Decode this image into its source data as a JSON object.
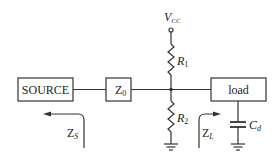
{
  "diagram": {
    "type": "circuit",
    "blocks": {
      "source": "SOURCE",
      "z0": "Z",
      "z0_sub": "0",
      "load": "load"
    },
    "supply": {
      "label": "V",
      "sub": "CC"
    },
    "resistors": [
      {
        "label": "R",
        "sub": "1"
      },
      {
        "label": "R",
        "sub": "2"
      }
    ],
    "capacitor": {
      "label": "C",
      "sub": "d"
    },
    "impedances": [
      {
        "label": "Z",
        "sub": "S",
        "direction": "left"
      },
      {
        "label": "Z",
        "sub": "L",
        "direction": "right"
      }
    ],
    "colors": {
      "stroke": "#333333",
      "background": "#ffffff"
    }
  }
}
